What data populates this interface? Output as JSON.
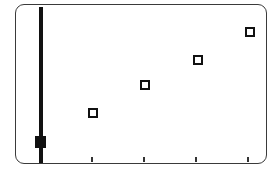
{
  "chart_data": {
    "type": "scatter",
    "title": "",
    "xlabel": "",
    "ylabel": "",
    "grid": false,
    "legend": null,
    "x_ticks": [
      1,
      2,
      3,
      4
    ],
    "x_tick_labels": [
      "",
      "",
      "",
      ""
    ],
    "series": [
      {
        "name": "",
        "marker": "hollow-square",
        "x": [
          1,
          2,
          3,
          4
        ],
        "y": [
          1.0,
          2.0,
          3.0,
          4.1
        ]
      }
    ],
    "xlim": [
      0,
      4.2
    ],
    "ylim": [
      0,
      5
    ],
    "annotations": [
      {
        "type": "vertical-bar-with-handle",
        "position": "left",
        "handle_position": "near-bottom"
      }
    ]
  },
  "colors": {
    "frame": "#3a3a3a",
    "bar": "#111111",
    "marker_stroke": "#111111",
    "marker_fill": "#ffffff",
    "tick": "#333333",
    "background": "#ffffff"
  },
  "layout": {
    "markers": [
      {
        "left": 88,
        "top": 108
      },
      {
        "left": 140,
        "top": 80
      },
      {
        "left": 193,
        "top": 55
      },
      {
        "left": 245,
        "top": 27
      }
    ],
    "ticks": [
      {
        "left": 91,
        "top": 157
      },
      {
        "left": 143,
        "top": 157
      },
      {
        "left": 195,
        "top": 157
      },
      {
        "left": 247,
        "top": 157
      }
    ]
  }
}
